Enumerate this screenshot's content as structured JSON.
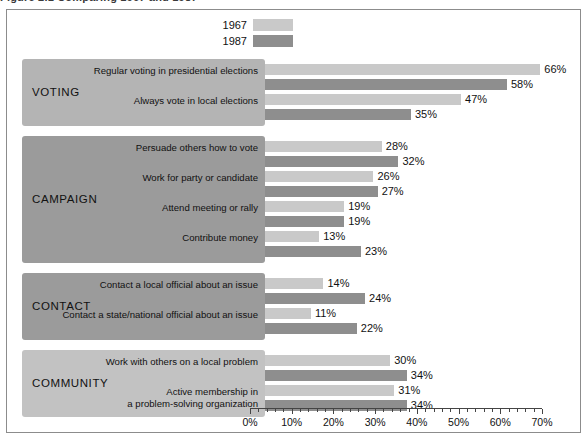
{
  "caption_fragment": "Figure 2.1  Comparing 1967 and 1987",
  "legend": {
    "entries": [
      {
        "label": "1967",
        "color": "#c9c9c9",
        "swatch_name": "legend-swatch-1967"
      },
      {
        "label": "1987",
        "color": "#8e8e8e",
        "swatch_name": "legend-swatch-1987"
      }
    ]
  },
  "axis": {
    "ticks": [
      "0%",
      "10%",
      "20%",
      "30%",
      "40%",
      "50%",
      "60%",
      "70%"
    ],
    "min": 0,
    "max": 70,
    "minor_step": 2,
    "major_step": 10
  },
  "chart_data": {
    "type": "bar",
    "orientation": "horizontal",
    "title": "",
    "xlabel": "",
    "ylabel": "",
    "xlim": [
      0,
      70
    ],
    "grid": false,
    "legend_position": "top",
    "series": [
      {
        "name": "1967",
        "color": "#c9c9c9"
      },
      {
        "name": "1987",
        "color": "#8e8e8e"
      }
    ],
    "groups": [
      {
        "name": "VOTING",
        "panel_color": "#b4b4b4",
        "items": [
          {
            "label": "Regular voting in presidential elections",
            "values": [
              66,
              58
            ],
            "value_labels": [
              "66%",
              "58%"
            ]
          },
          {
            "label": "Always vote in local elections",
            "values": [
              47,
              35
            ],
            "value_labels": [
              "47%",
              "35%"
            ]
          }
        ]
      },
      {
        "name": "CAMPAIGN",
        "panel_color": "#9b9b9b",
        "items": [
          {
            "label": "Persuade others how to vote",
            "values": [
              28,
              32
            ],
            "value_labels": [
              "28%",
              "32%"
            ]
          },
          {
            "label": "Work for party or candidate",
            "values": [
              26,
              27
            ],
            "value_labels": [
              "26%",
              "27%"
            ]
          },
          {
            "label": "Attend meeting or rally",
            "values": [
              19,
              19
            ],
            "value_labels": [
              "19%",
              "19%"
            ]
          },
          {
            "label": "Contribute money",
            "values": [
              13,
              23
            ],
            "value_labels": [
              "13%",
              "23%"
            ]
          }
        ]
      },
      {
        "name": "CONTACT",
        "panel_color": "#9b9b9b",
        "items": [
          {
            "label": "Contact a local official about an issue",
            "values": [
              14,
              24
            ],
            "value_labels": [
              "14%",
              "24%"
            ]
          },
          {
            "label": "Contact a state/national official about an issue",
            "values": [
              11,
              22
            ],
            "value_labels": [
              "11%",
              "22%"
            ]
          }
        ]
      },
      {
        "name": "COMMUNITY",
        "panel_color": "#c2c2c2",
        "items": [
          {
            "label": "Work with others on a local problem",
            "values": [
              30,
              34
            ],
            "value_labels": [
              "30%",
              "34%"
            ]
          },
          {
            "label": "Active membership in\na problem-solving organization",
            "values": [
              31,
              34
            ],
            "value_labels": [
              "31%",
              "34%"
            ]
          }
        ]
      }
    ]
  }
}
